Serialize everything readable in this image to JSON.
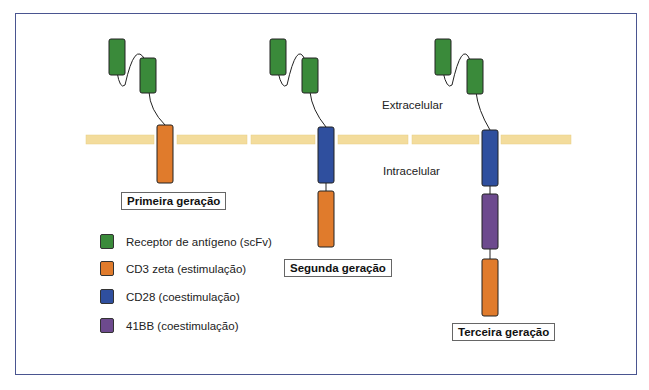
{
  "colors": {
    "scfv": "#3a8a3a",
    "cd3": "#e07b2c",
    "cd28": "#2f4f9e",
    "bb41": "#6d4a8e",
    "membrane": "#f3dc9c",
    "frame": "#4a5590"
  },
  "regions": {
    "extracellular": "Extracelular",
    "intracellular": "Intracelular"
  },
  "generations": [
    {
      "label": "Primeira geração"
    },
    {
      "label": "Segunda geração"
    },
    {
      "label": "Terceira geração"
    }
  ],
  "legend": [
    {
      "label": "Receptor de antígeno (scFv)",
      "color": "#3a8a3a"
    },
    {
      "label": "CD3 zeta (estimulação)",
      "color": "#e07b2c"
    },
    {
      "label": "CD28 (coestimulação)",
      "color": "#2f4f9e"
    },
    {
      "label": "41BB (coestimulação)",
      "color": "#6d4a8e"
    }
  ]
}
